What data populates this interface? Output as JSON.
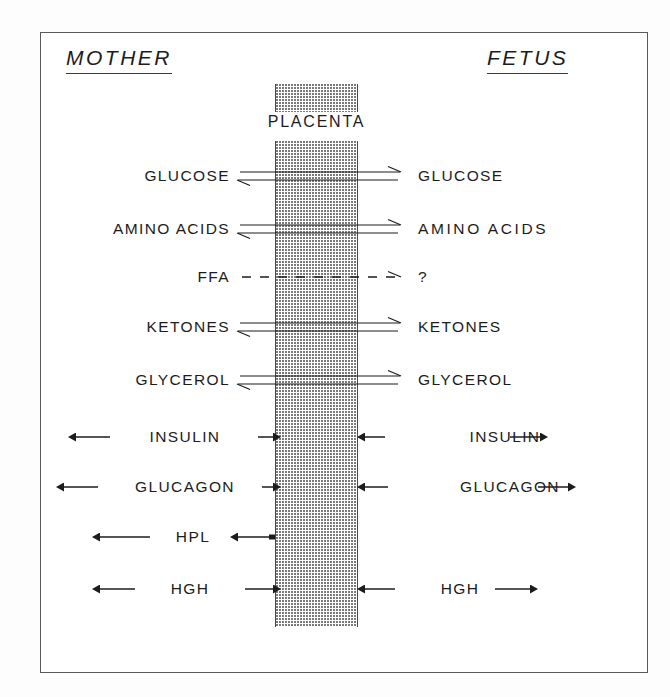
{
  "figure": {
    "type": "diagram",
    "background_color": "#ffffff",
    "frame_color": "#5a5a5a",
    "ink_color": "#1c1c1c",
    "stipple_color": "#7a7a7a"
  },
  "headings": {
    "left": "MOTHER",
    "right": "FETUS"
  },
  "placenta": {
    "label": "PLACENTA",
    "fill_pattern": "stipple",
    "x_left": 275,
    "x_right": 358
  },
  "rows": [
    {
      "id": "glucose",
      "left_label": "GLUCOSE",
      "right_label": "GLUCOSE",
      "arrow_type": "equilibrium",
      "crosses_placenta": true,
      "direction": "bidirectional",
      "y": 176
    },
    {
      "id": "amino-acids",
      "left_label": "AMINO ACIDS",
      "right_label": "AMINO ACIDS",
      "arrow_type": "equilibrium",
      "crosses_placenta": true,
      "direction": "bidirectional",
      "y": 229
    },
    {
      "id": "ffa",
      "left_label": "FFA",
      "right_label": "?",
      "arrow_type": "dashed",
      "crosses_placenta": true,
      "direction": "right",
      "y": 277
    },
    {
      "id": "ketones",
      "left_label": "KETONES",
      "right_label": "KETONES",
      "arrow_type": "equilibrium",
      "crosses_placenta": true,
      "direction": "bidirectional",
      "y": 327
    },
    {
      "id": "glycerol",
      "left_label": "GLYCEROL",
      "right_label": "GLYCEROL",
      "arrow_type": "equilibrium",
      "crosses_placenta": true,
      "direction": "bidirectional",
      "y": 380
    },
    {
      "id": "insulin",
      "left_label": "INSULIN",
      "right_label": "INSULIN",
      "arrow_type": "outward-pair",
      "crosses_placenta": false,
      "direction": "both-sides-outward",
      "y": 437
    },
    {
      "id": "glucagon",
      "left_label": "GLUCAGON",
      "right_label": "GLUCAGON",
      "arrow_type": "outward-pair",
      "crosses_placenta": false,
      "direction": "both-sides-outward",
      "y": 487
    },
    {
      "id": "hpl",
      "left_label": "HPL",
      "right_label": "",
      "arrow_type": "placenta-to-mother",
      "crosses_placenta": false,
      "direction": "left",
      "y": 537
    },
    {
      "id": "hgh",
      "left_label": "HGH",
      "right_label": "HGH",
      "arrow_type": "outward-pair",
      "crosses_placenta": false,
      "direction": "both-sides-outward",
      "y": 589
    }
  ]
}
